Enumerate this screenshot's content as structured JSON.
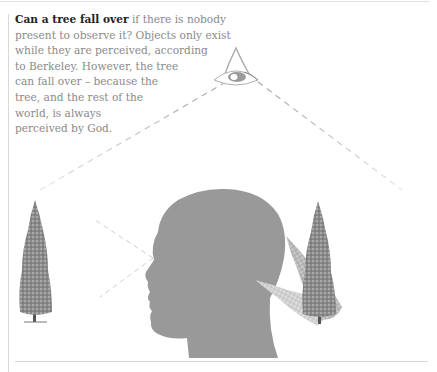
{
  "caption": {
    "lead": "Can a tree fall over",
    "lines": [
      " if there is nobody",
      "present to observe it? Objects only exist",
      "while they are perceived, according",
      "to Berkeley. However, the tree",
      "can fall over – because the",
      "tree, and the rest of the",
      "world, is always",
      "perceived by God."
    ]
  },
  "figure": {
    "elements": [
      {
        "name": "all-seeing-eye",
        "description": "eye of God inside a triangle"
      },
      {
        "name": "head-silhouette",
        "description": "grey human head in profile facing left"
      },
      {
        "name": "tree-left",
        "description": "upright conifer observed by the person"
      },
      {
        "name": "trees-right",
        "description": "conifer shown upright and in stages of falling over"
      }
    ],
    "colors": {
      "head": "#999999",
      "dash": "#b5b5b5",
      "tree": "#6e6e6e",
      "text": "#8a8a8a",
      "lead": "#222222"
    }
  }
}
